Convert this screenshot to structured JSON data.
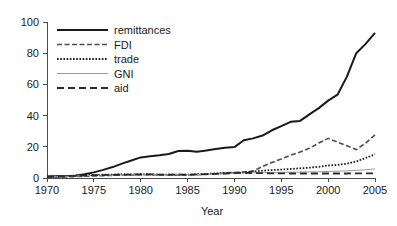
{
  "chart_data": {
    "type": "line",
    "title": "",
    "subtitle": "",
    "xlabel": "Year",
    "ylabel": "",
    "xlim": [
      1970,
      2005
    ],
    "ylim": [
      0,
      100
    ],
    "grid": false,
    "legend_position": "top-left-inside",
    "x_ticks": [
      1970,
      1975,
      1980,
      1985,
      1990,
      1995,
      2000,
      2005
    ],
    "x_tick_labels": [
      "1970",
      "1975",
      "1980",
      "1985",
      "1990",
      "1995",
      "2000",
      "2005"
    ],
    "y_ticks": [
      0,
      20,
      40,
      60,
      80,
      100
    ],
    "y_tick_labels": [
      "0",
      "20",
      "40",
      "60",
      "80",
      "100"
    ],
    "x": [
      1970,
      1971,
      1972,
      1973,
      1974,
      1975,
      1976,
      1977,
      1978,
      1979,
      1980,
      1981,
      1982,
      1983,
      1984,
      1985,
      1986,
      1987,
      1988,
      1989,
      1990,
      1991,
      1992,
      1993,
      1994,
      1995,
      1996,
      1997,
      1998,
      1999,
      2000,
      2001,
      2002,
      2003,
      2004,
      2005
    ],
    "series": [
      {
        "name": "remittances",
        "style": "solid",
        "color": "#1a1a1a",
        "width": 2,
        "values": [
          1.0,
          1.1,
          1.2,
          1.4,
          2.4,
          3.6,
          5.2,
          7.0,
          9.2,
          11.2,
          13.2,
          14.0,
          14.6,
          15.4,
          17.3,
          17.5,
          16.8,
          17.6,
          18.6,
          19.4,
          19.8,
          24.2,
          25.4,
          27.2,
          30.6,
          33.3,
          36.0,
          36.6,
          40.8,
          44.8,
          49.6,
          53.4,
          65.0,
          80.0,
          86.0,
          93.0
        ]
      },
      {
        "name": "FDI",
        "style": "dash-dot",
        "color": "#4d4d4d",
        "width": 1.6,
        "values": [
          0.5,
          0.6,
          0.7,
          0.9,
          1.1,
          1.3,
          1.5,
          1.7,
          1.9,
          2.0,
          2.1,
          2.2,
          2.0,
          1.9,
          1.9,
          2.0,
          2.1,
          2.3,
          2.7,
          3.2,
          3.5,
          3.8,
          4.4,
          7.4,
          10.0,
          12.2,
          14.6,
          16.6,
          19.0,
          22.4,
          25.4,
          23.0,
          20.6,
          18.2,
          22.4,
          27.6
        ]
      },
      {
        "name": "trade",
        "style": "dotted",
        "color": "#1a1a1a",
        "width": 1.8,
        "values": [
          0.9,
          1.1,
          1.3,
          1.6,
          1.9,
          2.0,
          2.1,
          2.2,
          2.3,
          2.3,
          2.4,
          2.3,
          2.2,
          2.2,
          2.2,
          2.1,
          2.4,
          2.6,
          2.9,
          3.1,
          3.3,
          3.6,
          4.2,
          4.7,
          5.1,
          5.4,
          5.8,
          6.2,
          6.6,
          7.2,
          8.0,
          8.4,
          9.2,
          10.6,
          12.8,
          15.2
        ]
      },
      {
        "name": "GNI",
        "style": "thin-solid",
        "color": "#9a9a9a",
        "width": 1,
        "values": [
          0.8,
          0.9,
          1.0,
          1.2,
          1.5,
          1.7,
          1.8,
          1.9,
          2.0,
          2.1,
          2.2,
          2.2,
          2.1,
          2.1,
          2.1,
          2.1,
          2.2,
          2.4,
          2.6,
          2.8,
          3.0,
          3.2,
          3.3,
          3.4,
          3.5,
          3.6,
          3.7,
          3.8,
          3.9,
          4.0,
          4.2,
          4.4,
          4.6,
          4.9,
          5.3,
          5.8
        ]
      },
      {
        "name": "aid",
        "style": "long-dash",
        "color": "#2a2a2a",
        "width": 1.8,
        "values": [
          0.8,
          0.9,
          1.1,
          1.3,
          1.6,
          1.8,
          1.9,
          2.0,
          2.1,
          2.2,
          2.3,
          2.3,
          2.2,
          2.2,
          2.2,
          2.2,
          2.3,
          2.5,
          2.7,
          2.9,
          3.1,
          3.3,
          3.2,
          3.1,
          3.0,
          3.0,
          2.9,
          2.9,
          2.9,
          2.9,
          2.9,
          2.9,
          2.9,
          3.0,
          3.0,
          3.0
        ]
      }
    ]
  },
  "legend": {
    "items": [
      {
        "label": "remittances"
      },
      {
        "label": "FDI"
      },
      {
        "label": "trade"
      },
      {
        "label": "GNI"
      },
      {
        "label": "aid"
      }
    ]
  },
  "axes": {
    "x_title": "Year"
  }
}
